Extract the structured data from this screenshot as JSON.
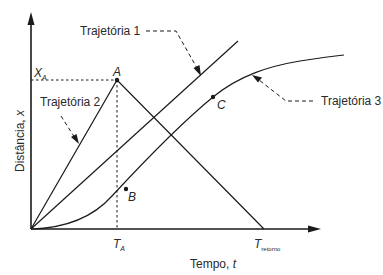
{
  "axes": {
    "x_label": "Tempo, ",
    "x_label_var": "t",
    "y_label": "Distância, ",
    "y_label_var": "x"
  },
  "ticks": {
    "x_ta_main": "T",
    "x_ta_sub": "A",
    "x_tret_main": "T",
    "x_tret_sub": "retorno",
    "y_xa_main": "X",
    "y_xa_sub": "A"
  },
  "points": {
    "A": "A",
    "B": "B",
    "C": "C"
  },
  "trajectories": [
    {
      "label": "Trajetória 1",
      "shape": "straight line from origin"
    },
    {
      "label": "Trajetória 2",
      "shape": "rise to A then return to zero at T_retorno"
    },
    {
      "label": "Trajetória 3",
      "shape": "accelerating then decelerating curve through B and C"
    }
  ],
  "colors": {
    "line": "#1a1a1a",
    "text": "#2a2a2a",
    "background": "#ffffff"
  }
}
